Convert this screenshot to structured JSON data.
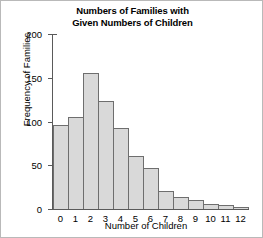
{
  "chart_data": {
    "type": "bar",
    "title": "Numbers of Families with Given Numbers of Children",
    "title_lines": [
      "Numbers of Families with",
      "Given Numbers of Children"
    ],
    "xlabel": "Number of Children",
    "ylabel": "Frequency of Families",
    "categories": [
      "0",
      "1",
      "2",
      "3",
      "4",
      "5",
      "6",
      "7",
      "8",
      "9",
      "10",
      "11",
      "12"
    ],
    "values": [
      96,
      105,
      155,
      123,
      93,
      61,
      47,
      21,
      14,
      10,
      6,
      4,
      2
    ],
    "ylim": [
      0,
      200
    ],
    "yticks": [
      0,
      50,
      100,
      150,
      200
    ],
    "ytick_labels": [
      "0",
      "50",
      "100",
      "150",
      "200"
    ],
    "grid": false,
    "legend": false,
    "bar_fill_color": "#d9d9d9",
    "bar_edge_color": "#6e6e6e",
    "axis_color": "#5a5a5a",
    "background_color": "#ffffff"
  }
}
